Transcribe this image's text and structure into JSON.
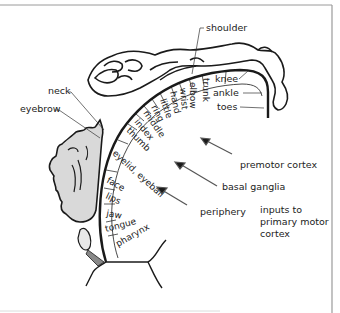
{
  "figure": {
    "body_part_labels": {
      "shoulder": "shoulder",
      "neck": "neck",
      "eyebrow": "eyebrow",
      "trunk": "trunk",
      "elbow": "elbow",
      "wrist": "wrist",
      "hand": "hand",
      "little": "little",
      "ring": "ring",
      "middle": "middle",
      "index": "index",
      "thumb": "thumb",
      "eyelid_eyeball": "eyelid, eyeball",
      "face": "face",
      "lips": "lips",
      "jaw": "jaw",
      "tongue": "tongue",
      "pharynx": "pharynx",
      "knee": "knee",
      "ankle": "ankle",
      "toes": "toes"
    },
    "inputs": {
      "premotor": "premotor cortex",
      "basal_ganglia": "basal ganglia",
      "periphery": "periphery",
      "caption_line1": "inputs to",
      "caption_line2": "primary motor",
      "caption_line3": "cortex"
    },
    "colors": {
      "line": "#1a1a1a",
      "face_fill": "#d9d9d9",
      "frame": "#9a9a9a",
      "arrow": "#555555"
    }
  }
}
